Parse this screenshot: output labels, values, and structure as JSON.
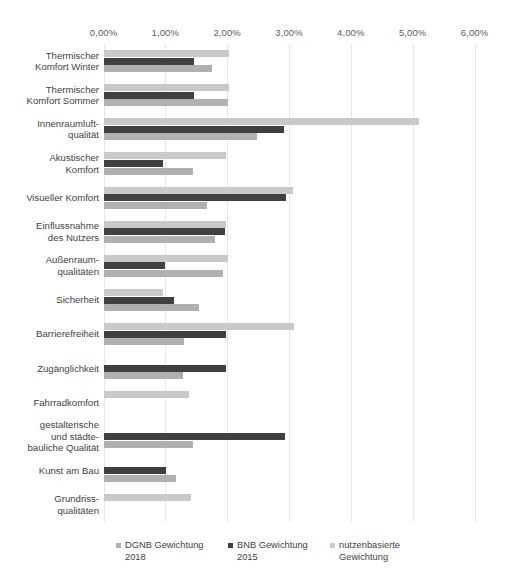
{
  "chart_data": {
    "type": "bar",
    "orientation": "horizontal",
    "title": "",
    "xlabel": "",
    "ylabel": "",
    "xlim": [
      0,
      6
    ],
    "xticks": [
      "0,00%",
      "1,00%",
      "2,00%",
      "3,00%",
      "4,00%",
      "5,00%",
      "6,00%"
    ],
    "xtick_values": [
      0,
      1,
      2,
      3,
      4,
      5,
      6
    ],
    "grid": true,
    "legend_position": "bottom",
    "categories": [
      "Thermischer\nKomfort Winter",
      "Thermischer\nKomfort Sommer",
      "Innenraumluft-\nqualität",
      "Akustischer\nKomfort",
      "Visueller Komfort",
      "Einflussnahme\ndes Nutzers",
      "Außenraum-\nqualitäten",
      "Sicherheit",
      "Barrierefreiheit",
      "Zugänglichkeit",
      "Fahrradkomfort",
      "gestalterische\nund städte-\nbauliche Qualität",
      "Kunst am Bau",
      "Grundriss-\nqualitäten"
    ],
    "series": [
      {
        "name": "DGNB Gewichtung\n2018",
        "color": "#b0b0b0",
        "values": [
          1.75,
          2.01,
          2.48,
          1.44,
          1.67,
          1.8,
          1.93,
          1.54,
          1.3,
          1.28,
          0,
          1.44,
          1.18,
          0
        ]
      },
      {
        "name": "BNB Gewichtung\n2015",
        "color": "#404040",
        "values": [
          1.46,
          1.46,
          2.92,
          0.96,
          2.95,
          1.96,
          0.99,
          1.14,
          1.98,
          1.98,
          0,
          2.94,
          1.01,
          0
        ]
      },
      {
        "name": "nutzenbasierte\nGewichtung",
        "color": "#c9c9c9",
        "values": [
          2.03,
          2.03,
          5.1,
          1.98,
          3.07,
          1.98,
          2.01,
          0.96,
          3.08,
          0,
          1.38,
          0,
          0,
          1.42
        ]
      }
    ]
  },
  "legend": {
    "items": [
      {
        "label": "DGNB Gewichtung\n2018",
        "color": "#b0b0b0"
      },
      {
        "label": "BNB Gewichtung\n2015",
        "color": "#404040"
      },
      {
        "label": "nutzenbasierte\nGewichtung",
        "color": "#c9c9c9"
      }
    ]
  }
}
